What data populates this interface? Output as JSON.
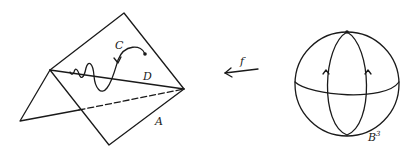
{
  "figure": {
    "left": {
      "labels": {
        "curve": "C",
        "line": "D",
        "plane": "A"
      }
    },
    "map": {
      "label": "f",
      "direction": "right-to-left arrow"
    },
    "right": {
      "label": "B",
      "label_superscript": "3"
    }
  }
}
